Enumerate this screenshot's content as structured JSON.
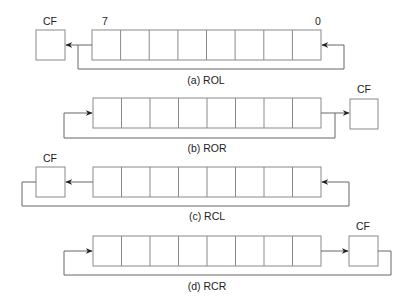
{
  "figure": {
    "diagrams": [
      {
        "id": "a",
        "caption": "(a) ROL",
        "operation": "Rotate Left",
        "cf_label": "CF",
        "bit_labels": {
          "msb": "7",
          "lsb": "0"
        },
        "cf_position": "left",
        "cells": 8
      },
      {
        "id": "b",
        "caption": "(b) ROR",
        "operation": "Rotate Right",
        "cf_label": "CF",
        "cf_position": "right",
        "cells": 8
      },
      {
        "id": "c",
        "caption": "(c) RCL",
        "operation": "Rotate through Carry Left",
        "cf_label": "CF",
        "cf_position": "left",
        "cells": 8
      },
      {
        "id": "d",
        "caption": "(d) RCR",
        "operation": "Rotate through Carry Right",
        "cf_label": "CF",
        "cf_position": "right",
        "cells": 8
      }
    ]
  },
  "colors": {
    "box_stroke": "#8a8a8a",
    "wire_stroke": "#666666",
    "text": "#222222",
    "background": "#ffffff"
  }
}
